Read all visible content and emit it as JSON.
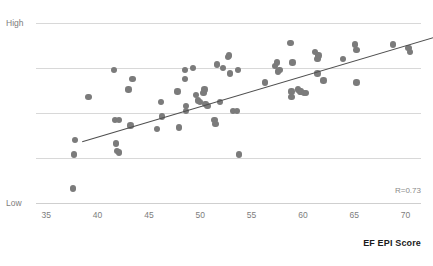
{
  "chart_data": {
    "type": "scatter",
    "title": "",
    "xlabel": "EF EPI Score",
    "ylabel": "",
    "xlim": [
      34.0,
      71.5
    ],
    "ylim": [
      0,
      100
    ],
    "grid": true,
    "legend": null,
    "x_ticks": [
      35,
      40,
      45,
      50,
      55,
      60,
      65,
      70
    ],
    "x_tick_labels": [
      "35",
      "40",
      "45",
      "50",
      "55",
      "60",
      "65",
      "70"
    ],
    "y_tick_labels": [
      "High",
      "Low"
    ],
    "y_axis_low_label": "Low",
    "y_axis_high_label": "High",
    "gridline_count": 5,
    "annotations": [
      {
        "text": "R=0.73",
        "position": "bottom-right"
      }
    ],
    "correlation_r": 0.73,
    "series": [
      {
        "name": "countries",
        "marker": "circle",
        "color": "#7b7b7b",
        "points": [
          [
            37.6,
            8
          ],
          [
            37.7,
            27
          ],
          [
            37.8,
            35
          ],
          [
            39.1,
            59
          ],
          [
            41.6,
            74
          ],
          [
            41.7,
            46
          ],
          [
            41.8,
            33
          ],
          [
            41.9,
            29
          ],
          [
            42.1,
            46
          ],
          [
            42.1,
            28
          ],
          [
            43.0,
            63
          ],
          [
            43.4,
            69
          ],
          [
            43.2,
            43
          ],
          [
            45.8,
            41
          ],
          [
            46.2,
            56
          ],
          [
            46.3,
            48
          ],
          [
            47.8,
            62
          ],
          [
            47.9,
            42
          ],
          [
            48.5,
            74
          ],
          [
            48.5,
            69
          ],
          [
            48.6,
            54
          ],
          [
            48.6,
            51
          ],
          [
            49.3,
            75
          ],
          [
            49.6,
            60
          ],
          [
            49.8,
            57
          ],
          [
            50.0,
            56
          ],
          [
            50.3,
            61
          ],
          [
            50.4,
            63
          ],
          [
            50.5,
            55
          ],
          [
            50.7,
            54
          ],
          [
            51.4,
            46
          ],
          [
            51.5,
            44
          ],
          [
            51.6,
            77
          ],
          [
            51.9,
            56
          ],
          [
            52.2,
            75
          ],
          [
            52.7,
            81
          ],
          [
            52.8,
            82
          ],
          [
            52.9,
            72
          ],
          [
            53.2,
            51
          ],
          [
            53.6,
            51
          ],
          [
            53.7,
            74
          ],
          [
            53.8,
            27
          ],
          [
            56.3,
            67
          ],
          [
            57.3,
            76
          ],
          [
            57.5,
            78
          ],
          [
            57.6,
            73
          ],
          [
            57.7,
            74
          ],
          [
            58.8,
            89
          ],
          [
            58.9,
            62
          ],
          [
            58.9,
            59
          ],
          [
            59.0,
            78
          ],
          [
            59.5,
            63
          ],
          [
            59.7,
            62
          ],
          [
            59.8,
            62
          ],
          [
            60.1,
            61
          ],
          [
            60.3,
            61
          ],
          [
            61.2,
            84
          ],
          [
            61.4,
            80
          ],
          [
            61.5,
            82
          ],
          [
            61.4,
            72
          ],
          [
            62.0,
            68
          ],
          [
            63.9,
            80
          ],
          [
            65.1,
            88
          ],
          [
            65.2,
            85
          ],
          [
            65.2,
            67
          ],
          [
            68.8,
            88
          ],
          [
            70.3,
            86
          ],
          [
            70.4,
            84
          ]
        ]
      }
    ],
    "trendline": {
      "type": "linear",
      "x_start": 38.5,
      "y_start": 34,
      "x_end": 72.8,
      "y_end": 92,
      "color": "#4f4f4f"
    }
  }
}
